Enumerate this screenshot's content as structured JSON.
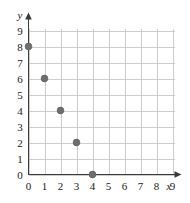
{
  "chart_data": {
    "type": "scatter",
    "title": "",
    "xlabel": "x",
    "ylabel": "y",
    "x": [
      0,
      1,
      2,
      3,
      4
    ],
    "values": [
      8,
      6,
      4,
      2,
      0
    ],
    "points": [
      {
        "x": 0,
        "y": 8
      },
      {
        "x": 1,
        "y": 6
      },
      {
        "x": 2,
        "y": 4
      },
      {
        "x": 3,
        "y": 2
      },
      {
        "x": 4,
        "y": 0
      }
    ],
    "xlim": [
      0,
      9
    ],
    "ylim": [
      0,
      9
    ],
    "xticks": [
      "0",
      "1",
      "2",
      "3",
      "4",
      "5",
      "6",
      "7",
      "8",
      "9"
    ],
    "yticks": [
      "0",
      "1",
      "2",
      "3",
      "4",
      "5",
      "6",
      "7",
      "8",
      "9"
    ],
    "grid": true,
    "legend": null,
    "marker_color": "#6e6e6e",
    "grid_color": "#c9c9c9",
    "axis_color": "#3a3a3a"
  }
}
